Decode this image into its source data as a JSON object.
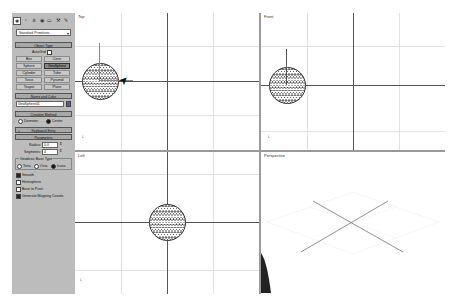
{
  "command_panel": {
    "tabs": [
      "create",
      "modify",
      "hierarchy",
      "motion",
      "display",
      "utilities"
    ],
    "category_dropdown": "Standard Primitives",
    "object_type": {
      "title": "Object Type",
      "autogrid_label": "AutoGrid",
      "buttons": [
        "Box",
        "Cone",
        "Sphere",
        "GeoSphere",
        "Cylinder",
        "Tube",
        "Torus",
        "Pyramid",
        "Teapot",
        "Plane"
      ],
      "active_button": "GeoSphere"
    },
    "name_and_color": {
      "title": "Name and Color",
      "name_value": "GeoSphere01",
      "color": "#5a5a9a"
    },
    "creation_method": {
      "title": "Creation Method",
      "options": [
        "Diameter",
        "Center"
      ],
      "selected": "Center"
    },
    "keyboard_entry": {
      "title": "Keyboard Entry"
    },
    "parameters": {
      "title": "Parameters",
      "radius_label": "Radius:",
      "radius_value": "0.0",
      "segments_label": "Segments:",
      "segments_value": "4",
      "base_type_label": "Geodesic Base Type",
      "base_types": [
        "Tetra",
        "Octa",
        "Icosa"
      ],
      "base_type_selected": "Icosa",
      "checkboxes": [
        {
          "label": "Smooth",
          "checked": true
        },
        {
          "label": "Hemisphere",
          "checked": false
        },
        {
          "label": "Base to Pivot",
          "checked": false
        },
        {
          "label": "Generate Mapping Coords.",
          "checked": true
        }
      ]
    }
  },
  "viewports": [
    {
      "label": "Top"
    },
    {
      "label": "Front"
    },
    {
      "label": "Left"
    },
    {
      "label": "Perspective"
    }
  ],
  "axis_labels": {
    "x": "x",
    "y": "y",
    "z": "z"
  }
}
